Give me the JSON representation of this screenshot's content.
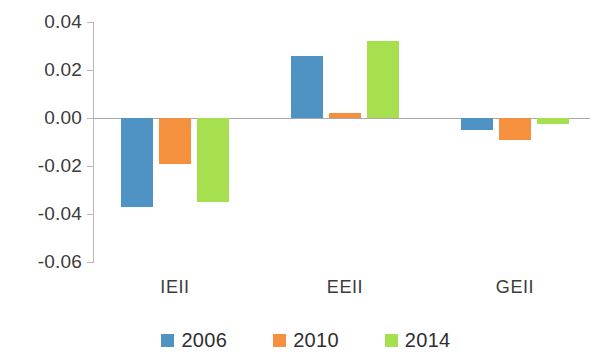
{
  "chart_data": {
    "type": "bar",
    "title": "",
    "subtitle": "",
    "xlabel": "",
    "ylabel": "",
    "categories": [
      "IEII",
      "EEII",
      "GEII"
    ],
    "series": [
      {
        "name": "2006",
        "color": "#4E93C4",
        "values": [
          -0.037,
          0.026,
          -0.005
        ]
      },
      {
        "name": "2010",
        "color": "#F5903E",
        "values": [
          -0.019,
          0.002,
          -0.009
        ]
      },
      {
        "name": "2014",
        "color": "#A6E04E",
        "values": [
          -0.035,
          0.032,
          -0.0025
        ]
      }
    ],
    "ylim": [
      -0.06,
      0.04
    ],
    "ytick_labels": [
      "0.04",
      "0.02",
      "0.00",
      "-0.02",
      "-0.04",
      "-0.06"
    ],
    "ytick_values": [
      0.04,
      0.02,
      0.0,
      -0.02,
      -0.04,
      -0.06
    ],
    "grid": false,
    "legend_position": "bottom",
    "zero_line": true
  },
  "axis": {
    "tick_color": "#b9b9b9",
    "zero_line_color": "#a8a8a8",
    "label_color": "#3b3b3b"
  }
}
